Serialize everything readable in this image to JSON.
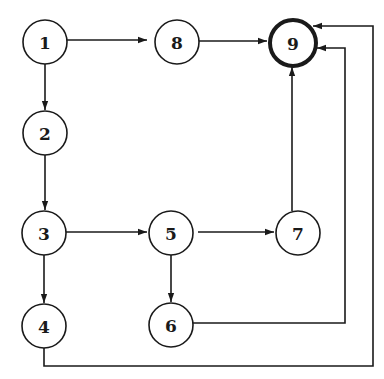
{
  "diagram": {
    "type": "directed-flow-graph",
    "nodes": [
      {
        "id": "1",
        "label": "1",
        "x": 45,
        "y": 42,
        "r": 22,
        "terminal": false
      },
      {
        "id": "8",
        "label": "8",
        "x": 177,
        "y": 42,
        "r": 22,
        "terminal": false
      },
      {
        "id": "9",
        "label": "9",
        "x": 293,
        "y": 43,
        "r": 23,
        "terminal": true
      },
      {
        "id": "2",
        "label": "2",
        "x": 45,
        "y": 133,
        "r": 22,
        "terminal": false
      },
      {
        "id": "3",
        "label": "3",
        "x": 44,
        "y": 233,
        "r": 22,
        "terminal": false
      },
      {
        "id": "5",
        "label": "5",
        "x": 171,
        "y": 233,
        "r": 22,
        "terminal": false
      },
      {
        "id": "7",
        "label": "7",
        "x": 298,
        "y": 233,
        "r": 22,
        "terminal": false
      },
      {
        "id": "4",
        "label": "4",
        "x": 44,
        "y": 326,
        "r": 22,
        "terminal": false
      },
      {
        "id": "6",
        "label": "6",
        "x": 171,
        "y": 325,
        "r": 22,
        "terminal": false
      }
    ],
    "edges": [
      {
        "from": "1",
        "to": "8",
        "points": [
          [
            67,
            40
          ],
          [
            147,
            40
          ]
        ]
      },
      {
        "from": "8",
        "to": "9",
        "points": [
          [
            199,
            41
          ],
          [
            267,
            41
          ]
        ]
      },
      {
        "from": "1",
        "to": "2",
        "points": [
          [
            45,
            64
          ],
          [
            45,
            110
          ]
        ]
      },
      {
        "from": "2",
        "to": "3",
        "points": [
          [
            45,
            155
          ],
          [
            45,
            210
          ]
        ]
      },
      {
        "from": "3",
        "to": "5",
        "points": [
          [
            66,
            232
          ],
          [
            147,
            232
          ]
        ]
      },
      {
        "from": "5",
        "to": "7",
        "points": [
          [
            198,
            232
          ],
          [
            274,
            232
          ]
        ]
      },
      {
        "from": "3",
        "to": "4",
        "points": [
          [
            44,
            255
          ],
          [
            44,
            303
          ]
        ]
      },
      {
        "from": "5",
        "to": "6",
        "points": [
          [
            171,
            255
          ],
          [
            171,
            302
          ]
        ]
      },
      {
        "from": "7",
        "to": "9",
        "points": [
          [
            292,
            211
          ],
          [
            292,
            67
          ]
        ]
      },
      {
        "from": "6",
        "to": "9",
        "points": [
          [
            193,
            323
          ],
          [
            345,
            323
          ],
          [
            345,
            48
          ],
          [
            317,
            48
          ]
        ]
      },
      {
        "from": "4",
        "to": "9",
        "points": [
          [
            44,
            348
          ],
          [
            44,
            366
          ],
          [
            373,
            366
          ],
          [
            373,
            26
          ],
          [
            313,
            26
          ]
        ]
      }
    ]
  }
}
